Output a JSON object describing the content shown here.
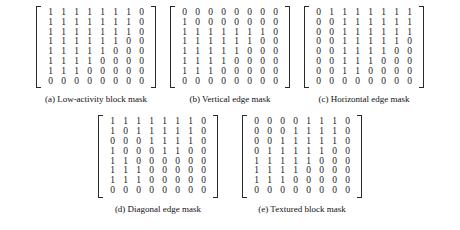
{
  "figure": {
    "matrix_bracket": {
      "left": "[",
      "right": "]"
    },
    "subfigures": [
      {
        "id": "a",
        "caption": "(a) Low-activity block mask",
        "rows": [
          [
            "1",
            "1",
            "1",
            "1",
            "1",
            "1",
            "1",
            "0"
          ],
          [
            "1",
            "1",
            "1",
            "1",
            "1",
            "1",
            "1",
            "0"
          ],
          [
            "1",
            "1",
            "1",
            "1",
            "1",
            "1",
            "1",
            "0"
          ],
          [
            "1",
            "1",
            "1",
            "1",
            "1",
            "1",
            "0",
            "0"
          ],
          [
            "1",
            "1",
            "1",
            "1",
            "1",
            "0",
            "0",
            "0"
          ],
          [
            "1",
            "1",
            "1",
            "1",
            "0",
            "0",
            "0",
            "0"
          ],
          [
            "1",
            "1",
            "1",
            "0",
            "0",
            "0",
            "0",
            "0"
          ],
          [
            "0",
            "0",
            "0",
            "0",
            "0",
            "0",
            "0",
            "0"
          ]
        ]
      },
      {
        "id": "b",
        "caption": "(b) Vertical edge mask",
        "rows": [
          [
            "0",
            "0",
            "0",
            "0",
            "0",
            "0",
            "0",
            "0"
          ],
          [
            "1",
            "0",
            "0",
            "0",
            "0",
            "0",
            "0",
            "0"
          ],
          [
            "1",
            "1",
            "1",
            "1",
            "1",
            "1",
            "1",
            "0"
          ],
          [
            "1",
            "1",
            "1",
            "1",
            "1",
            "1",
            "0",
            "0"
          ],
          [
            "1",
            "1",
            "1",
            "1",
            "1",
            "0",
            "0",
            "0"
          ],
          [
            "1",
            "1",
            "1",
            "1",
            "0",
            "0",
            "0",
            "0"
          ],
          [
            "1",
            "1",
            "1",
            "0",
            "0",
            "0",
            "0",
            "0"
          ],
          [
            "0",
            "0",
            "0",
            "0",
            "0",
            "0",
            "0",
            "0"
          ]
        ]
      },
      {
        "id": "c",
        "caption": "(c) Horizontal edge mask",
        "rows": [
          [
            "0",
            "1",
            "1",
            "1",
            "1",
            "1",
            "1",
            "1"
          ],
          [
            "0",
            "0",
            "1",
            "1",
            "1",
            "1",
            "1",
            "1"
          ],
          [
            "0",
            "0",
            "1",
            "1",
            "1",
            "1",
            "1",
            "1"
          ],
          [
            "0",
            "0",
            "1",
            "1",
            "1",
            "1",
            "1",
            "0"
          ],
          [
            "0",
            "0",
            "1",
            "1",
            "1",
            "1",
            "0",
            "0"
          ],
          [
            "0",
            "0",
            "1",
            "1",
            "1",
            "0",
            "0",
            "0"
          ],
          [
            "0",
            "0",
            "1",
            "1",
            "0",
            "0",
            "0",
            "0"
          ],
          [
            "0",
            "0",
            "0",
            "0",
            "0",
            "0",
            "0",
            "0"
          ]
        ]
      },
      {
        "id": "d",
        "caption": "(d) Diagonal edge mask",
        "rows": [
          [
            "1",
            "1",
            "1",
            "1",
            "1",
            "1",
            "1",
            "0"
          ],
          [
            "1",
            "0",
            "1",
            "1",
            "1",
            "1",
            "1",
            "0"
          ],
          [
            "0",
            "0",
            "0",
            "1",
            "1",
            "1",
            "1",
            "0"
          ],
          [
            "1",
            "0",
            "0",
            "0",
            "1",
            "1",
            "0",
            "0"
          ],
          [
            "1",
            "1",
            "0",
            "0",
            "0",
            "0",
            "0",
            "0"
          ],
          [
            "1",
            "1",
            "1",
            "0",
            "0",
            "0",
            "0",
            "0"
          ],
          [
            "1",
            "1",
            "1",
            "0",
            "0",
            "0",
            "0",
            "0"
          ],
          [
            "0",
            "0",
            "0",
            "0",
            "0",
            "0",
            "0",
            "0"
          ]
        ]
      },
      {
        "id": "e",
        "caption": "(e) Textured block mask",
        "rows": [
          [
            "0",
            "0",
            "0",
            "0",
            "1",
            "1",
            "1",
            "0"
          ],
          [
            "0",
            "0",
            "0",
            "1",
            "1",
            "1",
            "1",
            "0"
          ],
          [
            "0",
            "0",
            "1",
            "1",
            "1",
            "1",
            "1",
            "0"
          ],
          [
            "0",
            "1",
            "1",
            "1",
            "1",
            "1",
            "0",
            "0"
          ],
          [
            "1",
            "1",
            "1",
            "1",
            "1",
            "0",
            "0",
            "0"
          ],
          [
            "1",
            "1",
            "1",
            "1",
            "0",
            "0",
            "0",
            "0"
          ],
          [
            "1",
            "1",
            "1",
            "0",
            "0",
            "0",
            "0",
            "0"
          ],
          [
            "0",
            "0",
            "0",
            "0",
            "0",
            "0",
            "0",
            "0"
          ]
        ]
      }
    ]
  }
}
